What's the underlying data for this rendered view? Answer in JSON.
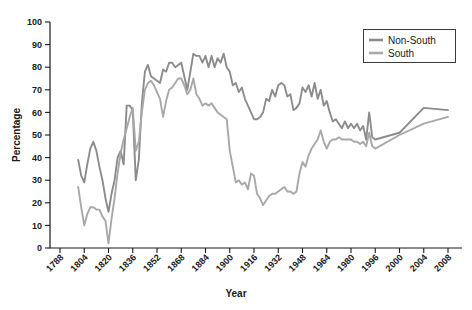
{
  "chart_data": {
    "type": "line",
    "title": "",
    "xlabel": "Year",
    "ylabel": "Percentage",
    "xlim": [
      1788,
      2008
    ],
    "ylim": [
      0,
      100
    ],
    "grid": false,
    "legend_position": "top-right",
    "y_ticks": [
      0,
      10,
      20,
      30,
      40,
      50,
      60,
      70,
      80,
      90,
      100
    ],
    "x_tick_labels": [
      "1788",
      "1804",
      "1820",
      "1836",
      "1852",
      "1868",
      "1884",
      "1900",
      "1916",
      "1932",
      "1948",
      "1964",
      "1980",
      "1996",
      "2000",
      "2004",
      "2008"
    ],
    "series": [
      {
        "name": "Non-South",
        "color": "#8c8c8c",
        "points": [
          [
            1800,
            39
          ],
          [
            1802,
            32
          ],
          [
            1804,
            29
          ],
          [
            1806,
            37
          ],
          [
            1808,
            44
          ],
          [
            1810,
            47
          ],
          [
            1812,
            43
          ],
          [
            1814,
            36
          ],
          [
            1816,
            30
          ],
          [
            1818,
            22
          ],
          [
            1820,
            16
          ],
          [
            1822,
            24
          ],
          [
            1824,
            30
          ],
          [
            1826,
            40
          ],
          [
            1828,
            43
          ],
          [
            1830,
            37
          ],
          [
            1832,
            63
          ],
          [
            1834,
            63
          ],
          [
            1836,
            61
          ],
          [
            1838,
            30
          ],
          [
            1840,
            39
          ],
          [
            1842,
            64
          ],
          [
            1844,
            78
          ],
          [
            1846,
            81
          ],
          [
            1848,
            76
          ],
          [
            1850,
            75
          ],
          [
            1852,
            74
          ],
          [
            1854,
            73
          ],
          [
            1856,
            79
          ],
          [
            1858,
            78
          ],
          [
            1860,
            82
          ],
          [
            1862,
            82
          ],
          [
            1864,
            80
          ],
          [
            1866,
            81
          ],
          [
            1868,
            82
          ],
          [
            1870,
            76
          ],
          [
            1872,
            70
          ],
          [
            1874,
            78
          ],
          [
            1876,
            86
          ],
          [
            1878,
            85
          ],
          [
            1880,
            85
          ],
          [
            1882,
            82
          ],
          [
            1884,
            85
          ],
          [
            1886,
            80
          ],
          [
            1888,
            85
          ],
          [
            1890,
            80
          ],
          [
            1892,
            84
          ],
          [
            1894,
            82
          ],
          [
            1896,
            86
          ],
          [
            1898,
            80
          ],
          [
            1900,
            78
          ],
          [
            1902,
            72
          ],
          [
            1904,
            73
          ],
          [
            1906,
            69
          ],
          [
            1908,
            71
          ],
          [
            1910,
            66
          ],
          [
            1912,
            63
          ],
          [
            1914,
            60
          ],
          [
            1916,
            57
          ],
          [
            1918,
            57
          ],
          [
            1920,
            58
          ],
          [
            1922,
            60
          ],
          [
            1924,
            66
          ],
          [
            1926,
            65
          ],
          [
            1928,
            70
          ],
          [
            1930,
            67
          ],
          [
            1932,
            72
          ],
          [
            1934,
            73
          ],
          [
            1936,
            72
          ],
          [
            1938,
            67
          ],
          [
            1940,
            68
          ],
          [
            1942,
            61
          ],
          [
            1944,
            62
          ],
          [
            1946,
            64
          ],
          [
            1948,
            71
          ],
          [
            1950,
            69
          ],
          [
            1952,
            72
          ],
          [
            1954,
            67
          ],
          [
            1956,
            73
          ],
          [
            1958,
            66
          ],
          [
            1960,
            70
          ],
          [
            1962,
            63
          ],
          [
            1964,
            65
          ],
          [
            1966,
            60
          ],
          [
            1968,
            56
          ],
          [
            1970,
            57
          ],
          [
            1972,
            55
          ],
          [
            1974,
            53
          ],
          [
            1976,
            56
          ],
          [
            1978,
            53
          ],
          [
            1980,
            55
          ],
          [
            1982,
            53
          ],
          [
            1984,
            55
          ],
          [
            1986,
            52
          ],
          [
            1988,
            54
          ],
          [
            1990,
            48
          ],
          [
            1992,
            60
          ],
          [
            1994,
            49
          ],
          [
            1996,
            48
          ],
          [
            2000,
            51
          ],
          [
            2004,
            62
          ],
          [
            2008,
            61
          ]
        ]
      },
      {
        "name": "South",
        "color": "#a8a8a8",
        "points": [
          [
            1800,
            27
          ],
          [
            1802,
            18
          ],
          [
            1804,
            10
          ],
          [
            1806,
            15
          ],
          [
            1808,
            18
          ],
          [
            1810,
            18
          ],
          [
            1812,
            17
          ],
          [
            1814,
            17
          ],
          [
            1816,
            14
          ],
          [
            1818,
            12
          ],
          [
            1820,
            2
          ],
          [
            1822,
            13
          ],
          [
            1824,
            22
          ],
          [
            1826,
            33
          ],
          [
            1828,
            42
          ],
          [
            1830,
            48
          ],
          [
            1832,
            53
          ],
          [
            1834,
            58
          ],
          [
            1836,
            62
          ],
          [
            1838,
            43
          ],
          [
            1840,
            47
          ],
          [
            1842,
            60
          ],
          [
            1844,
            70
          ],
          [
            1846,
            73
          ],
          [
            1848,
            74
          ],
          [
            1850,
            72
          ],
          [
            1852,
            69
          ],
          [
            1854,
            66
          ],
          [
            1856,
            58
          ],
          [
            1858,
            65
          ],
          [
            1860,
            70
          ],
          [
            1862,
            71
          ],
          [
            1864,
            73
          ],
          [
            1866,
            75
          ],
          [
            1868,
            75
          ],
          [
            1870,
            72
          ],
          [
            1872,
            68
          ],
          [
            1874,
            70
          ],
          [
            1876,
            75
          ],
          [
            1878,
            68
          ],
          [
            1880,
            66
          ],
          [
            1882,
            63
          ],
          [
            1884,
            64
          ],
          [
            1886,
            63
          ],
          [
            1888,
            64
          ],
          [
            1890,
            62
          ],
          [
            1892,
            60
          ],
          [
            1894,
            59
          ],
          [
            1896,
            58
          ],
          [
            1898,
            57
          ],
          [
            1900,
            43
          ],
          [
            1902,
            36
          ],
          [
            1904,
            29
          ],
          [
            1906,
            30
          ],
          [
            1908,
            28
          ],
          [
            1910,
            29
          ],
          [
            1912,
            26
          ],
          [
            1914,
            33
          ],
          [
            1916,
            32
          ],
          [
            1918,
            24
          ],
          [
            1920,
            22
          ],
          [
            1922,
            19
          ],
          [
            1924,
            21
          ],
          [
            1926,
            23
          ],
          [
            1928,
            24
          ],
          [
            1930,
            24
          ],
          [
            1932,
            25
          ],
          [
            1934,
            26
          ],
          [
            1936,
            27
          ],
          [
            1938,
            25
          ],
          [
            1940,
            25
          ],
          [
            1942,
            24
          ],
          [
            1944,
            25
          ],
          [
            1946,
            33
          ],
          [
            1948,
            38
          ],
          [
            1950,
            36
          ],
          [
            1952,
            41
          ],
          [
            1954,
            44
          ],
          [
            1956,
            46
          ],
          [
            1958,
            48
          ],
          [
            1960,
            52
          ],
          [
            1962,
            47
          ],
          [
            1964,
            44
          ],
          [
            1966,
            47
          ],
          [
            1968,
            48
          ],
          [
            1970,
            48
          ],
          [
            1972,
            49
          ],
          [
            1974,
            48
          ],
          [
            1976,
            48
          ],
          [
            1978,
            48
          ],
          [
            1980,
            48
          ],
          [
            1982,
            47
          ],
          [
            1984,
            47
          ],
          [
            1986,
            46
          ],
          [
            1988,
            47
          ],
          [
            1990,
            45
          ],
          [
            1992,
            51
          ],
          [
            1994,
            45
          ],
          [
            1996,
            44
          ],
          [
            2000,
            50
          ],
          [
            2004,
            55
          ],
          [
            2008,
            58
          ]
        ]
      }
    ]
  },
  "legend": {
    "entries": [
      {
        "label": "Non-South"
      },
      {
        "label": "South"
      }
    ]
  },
  "axes": {
    "y_title": "Percentage",
    "x_title": "Year"
  }
}
